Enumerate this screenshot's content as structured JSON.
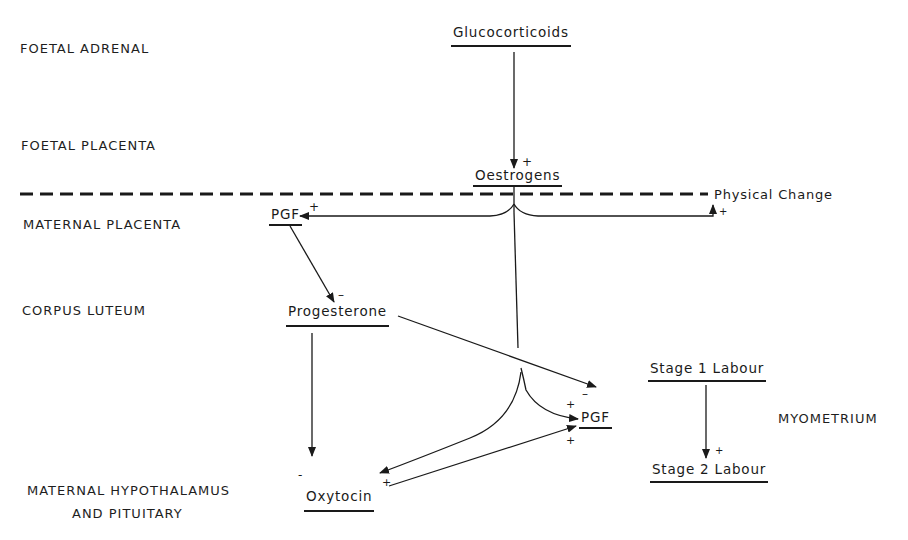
{
  "regions": {
    "foetal_adrenal": "FOETAL ADRENAL",
    "foetal_placenta": "FOETAL PLACENTA",
    "maternal_placenta": "MATERNAL PLACENTA",
    "corpus_luteum": "CORPUS LUTEUM",
    "myometrium": "MYOMETRIUM",
    "maternal_hypothalamus_line1": "MATERNAL HYPOTHALAMUS",
    "maternal_hypothalamus_line2": "AND PITUITARY"
  },
  "nodes": {
    "glucocorticoids": "Glucocorticoids",
    "oestrogens": "Oestrogens",
    "physical_change": "Physical Change",
    "pgf_placenta": "PGF",
    "progesterone": "Progesterone",
    "pgf_myometrium": "PGF",
    "oxytocin": "Oxytocin",
    "stage1_labour": "Stage 1 Labour",
    "stage2_labour": "Stage 2 Labour"
  },
  "signs": {
    "oestrogens_plus": "+",
    "pgf_placenta_plus": "+",
    "physical_change_plus": "+",
    "progesterone_minus": "–",
    "pgf_myometrium_minus": "–",
    "pgf_myometrium_plus_top": "+",
    "pgf_myometrium_plus_bottom": "+",
    "oxytocin_minus": "-",
    "oxytocin_plus": "+",
    "stage2_plus": "+"
  },
  "colors": {
    "ink": "#1a1a1a",
    "background": "#ffffff"
  }
}
